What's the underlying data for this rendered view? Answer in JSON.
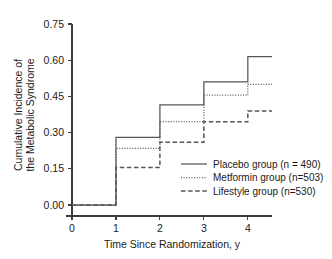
{
  "chart_data": {
    "type": "line",
    "subtype": "step-kaplan-meier",
    "title": "",
    "xlabel": "Time Since Randomization, y",
    "ylabel": "Cumulative Incidence of the Metabolic Syndrome",
    "ylabel_line1": "Cumulative Incidence of",
    "ylabel_line2": "the Metabolic Syndrome",
    "xlim": [
      0,
      4.55
    ],
    "ylim": [
      0,
      0.75
    ],
    "xticks": [
      0,
      1,
      2,
      3,
      4
    ],
    "xticklabels": [
      "0",
      "1",
      "2",
      "3",
      "4"
    ],
    "yticks": [
      0.0,
      0.15,
      0.3,
      0.45,
      0.6,
      0.75
    ],
    "yticklabels": [
      "0.00",
      "0.15",
      "0.30",
      "0.45",
      "0.60",
      "0.75"
    ],
    "grid": false,
    "legend_position": "center-right-inside",
    "x": [
      0,
      1,
      2,
      3,
      4,
      4.55
    ],
    "series": [
      {
        "name": "Placebo group (n = 490)",
        "style": "solid",
        "color": "#555555",
        "values": [
          0.0,
          0.28,
          0.415,
          0.51,
          0.615,
          0.615
        ]
      },
      {
        "name": "Metformin group (n=503)",
        "style": "dotted",
        "color": "#555555",
        "values": [
          0.0,
          0.235,
          0.345,
          0.455,
          0.5,
          0.5
        ]
      },
      {
        "name": "Lifestyle group (n=530)",
        "style": "dashed",
        "color": "#555555",
        "values": [
          0.0,
          0.155,
          0.26,
          0.345,
          0.39,
          0.39
        ]
      }
    ]
  },
  "legend": {
    "entries": [
      {
        "label": "Placebo group (n = 490)",
        "style": "solid"
      },
      {
        "label": "Metformin group (n=503)",
        "style": "dotted"
      },
      {
        "label": "Lifestyle group (n=530)",
        "style": "dashed"
      }
    ]
  }
}
